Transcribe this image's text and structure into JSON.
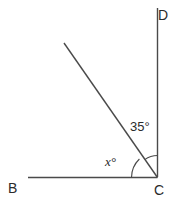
{
  "figure": {
    "type": "geometry-angle-diagram",
    "stroke_color": "#4a4a4a",
    "text_color": "#2b2b2b",
    "background_color": "#ffffff",
    "points": {
      "B": {
        "label": "B",
        "x": 28,
        "y": 177
      },
      "C": {
        "label": "C",
        "x": 157,
        "y": 177
      },
      "D": {
        "label": "D",
        "x": 157,
        "y": 8
      },
      "A": {
        "label": "",
        "x": 64,
        "y": 43
      }
    },
    "segments": [
      {
        "name": "ray-CB",
        "from": "C",
        "to": "B"
      },
      {
        "name": "ray-CD",
        "from": "C",
        "to": "D"
      },
      {
        "name": "ray-CA",
        "from": "C",
        "to": "A"
      }
    ],
    "angles": [
      {
        "name": "angle-DCA",
        "label": "35°",
        "value": 35,
        "unit": "degrees",
        "between": [
          "ray-CD",
          "ray-CA"
        ],
        "arc_radius": 22
      },
      {
        "name": "angle-BCA",
        "label": "x°",
        "value": "x",
        "unit": "degrees",
        "between": [
          "ray-CB",
          "ray-CA"
        ],
        "arc_radius": 26
      }
    ]
  },
  "labels": {
    "point_b": "B",
    "point_c": "C",
    "point_d": "D",
    "angle_35": "35°",
    "angle_x": "x°"
  }
}
